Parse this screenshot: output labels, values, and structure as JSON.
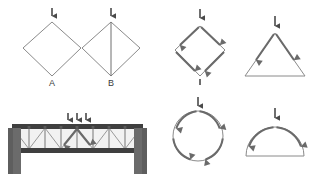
{
  "figure": {
    "background_color": "#ffffff",
    "line_color": "#8a8a8a",
    "arrow_color": "#6a6a6a",
    "load_arrow_color": "#4a4a4a",
    "truss_color": "#3f3f3f",
    "pier_color": "#6b6b6b",
    "width": 311,
    "height": 179
  },
  "panels": [
    {
      "id": "diamond-a",
      "shape": "diamond",
      "label": "A",
      "has_center_strut": false,
      "has_force_arrows": false,
      "load_arrows": 1,
      "center_x": 52,
      "center_y": 47
    },
    {
      "id": "diamond-b",
      "shape": "diamond",
      "label": "B",
      "has_center_strut": true,
      "has_force_arrows": false,
      "load_arrows": 1,
      "center_x": 111,
      "center_y": 47
    },
    {
      "id": "diamond-forces",
      "shape": "diamond",
      "label": "",
      "has_center_strut": false,
      "has_force_arrows": true,
      "force_arrow_count": 4,
      "load_arrows": 1,
      "center_x": 200,
      "center_y": 47
    },
    {
      "id": "triangle-forces",
      "shape": "triangle",
      "label": "",
      "has_force_arrows": true,
      "force_arrow_count": 2,
      "load_arrows": 1,
      "center_x": 275,
      "center_y": 50
    },
    {
      "id": "circle-forces",
      "shape": "circle",
      "label": "",
      "has_force_arrows": true,
      "force_arrow_count": 4,
      "load_arrows": 1,
      "center_x": 198,
      "center_y": 136
    },
    {
      "id": "arch-forces",
      "shape": "semicircular-arch",
      "label": "",
      "has_force_arrows": true,
      "force_arrow_count": 2,
      "load_arrows": 1,
      "center_x": 275,
      "center_y": 145
    },
    {
      "id": "truss-bridge",
      "shape": "truss-bridge",
      "label": "",
      "load_arrows": 3,
      "internal_force_arrows": 2,
      "bay_count": 8,
      "has_piers": true,
      "center_x": 77,
      "center_y": 145
    }
  ],
  "labels": {
    "a": "A",
    "b": "B"
  },
  "icons": {
    "load_arrow": "downward-load-arrow-icon",
    "force_arrow": "force-flow-arrow-icon"
  }
}
